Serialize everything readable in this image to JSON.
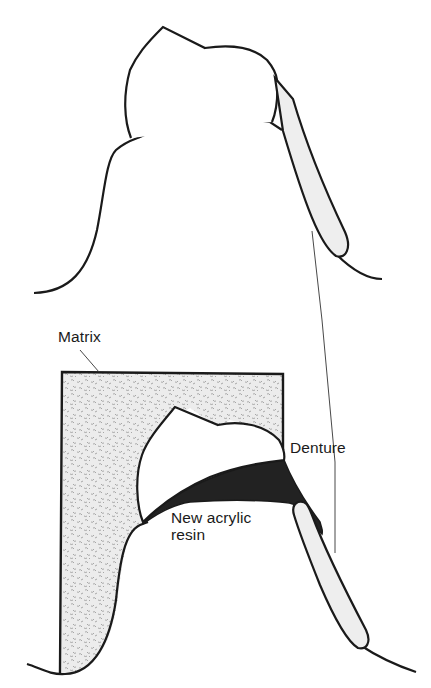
{
  "figure": {
    "colors": {
      "outline": "#1a1a1a",
      "clasp_fill": "#eeeeee",
      "matrix_fill": "#e6e6e6",
      "resin_fill": "#222222",
      "background": "#ffffff"
    }
  },
  "labels": {
    "matrix": "Matrix",
    "denture": "Denture",
    "new_acrylic_resin_line1": "New acrylic",
    "new_acrylic_resin_line2": "resin"
  }
}
